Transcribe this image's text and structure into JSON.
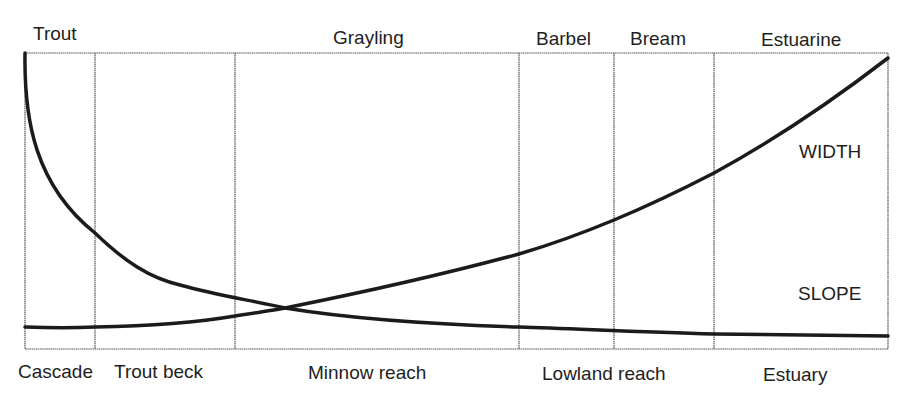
{
  "fish_zones": [
    {
      "label": "Trout",
      "x": 33
    },
    {
      "label": "Grayling",
      "x": 333
    },
    {
      "label": "Barbel",
      "x": 536
    },
    {
      "label": "Bream",
      "x": 630
    },
    {
      "label": "Estuarine",
      "x": 761
    }
  ],
  "river_zones": [
    {
      "label": "Cascade",
      "x": 18
    },
    {
      "label": "Trout beck",
      "x": 114
    },
    {
      "label": "Minnow reach",
      "x": 308
    },
    {
      "label": "Lowland reach",
      "x": 542
    },
    {
      "label": "Estuary",
      "x": 763
    }
  ],
  "curves": {
    "width_label": "WIDTH",
    "slope_label": "SLOPE"
  },
  "frame": {
    "left": 25,
    "right": 888,
    "top": 53,
    "bottom": 349
  },
  "dividers": [
    95,
    235,
    519,
    614,
    714
  ],
  "colors": {
    "line": "#1b1b1b",
    "frame": "#555555"
  }
}
